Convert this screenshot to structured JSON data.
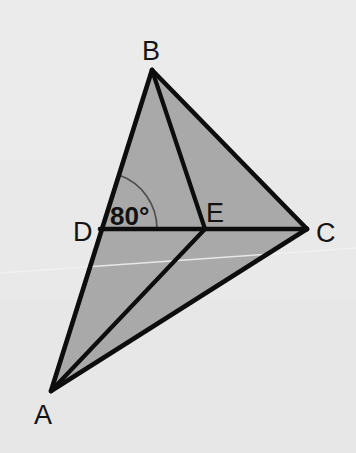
{
  "figure": {
    "background_color": "#e9e9e9",
    "fill_color": "#a9a9a9",
    "stroke_color": "#0d0d0d",
    "width": 356,
    "height": 453,
    "vertices": [
      {
        "id": "A",
        "label": "A",
        "x": 51,
        "y": 391,
        "label_x": 34,
        "label_y": 424
      },
      {
        "id": "B",
        "label": "B",
        "x": 152,
        "y": 70,
        "label_x": 142,
        "label_y": 60
      },
      {
        "id": "C",
        "label": "C",
        "x": 307,
        "y": 229,
        "label_x": 316,
        "label_y": 242
      },
      {
        "id": "D",
        "label": "D",
        "x": 100,
        "y": 229,
        "label_x": 73,
        "label_y": 241
      },
      {
        "id": "E",
        "label": "E",
        "x": 205,
        "y": 229,
        "label_x": 206,
        "label_y": 222
      }
    ],
    "edges": [
      {
        "from": "A",
        "to": "B",
        "name": "segment-AB"
      },
      {
        "from": "B",
        "to": "C",
        "name": "segment-BC"
      },
      {
        "from": "A",
        "to": "C",
        "name": "segment-AC"
      },
      {
        "from": "D",
        "to": "C",
        "name": "segment-DC"
      },
      {
        "from": "B",
        "to": "E",
        "name": "segment-BE"
      },
      {
        "from": "A",
        "to": "E",
        "name": "segment-AE"
      }
    ],
    "shaded_regions": [
      {
        "name": "region-ABC",
        "points": "51,391 152,70 307,229"
      }
    ],
    "angle_markers": [
      {
        "name": "angle-BDC",
        "at_vertex": "D",
        "value": "80°",
        "label_x": 110,
        "label_y": 225,
        "arc_radius": 57,
        "arc_start_x": 119,
        "arc_start_y": 175,
        "arc_end_x": 157,
        "arc_end_y": 229
      }
    ],
    "artifacts": [
      {
        "name": "paper-crease",
        "path": "M 0,273 L 356,248"
      }
    ]
  }
}
